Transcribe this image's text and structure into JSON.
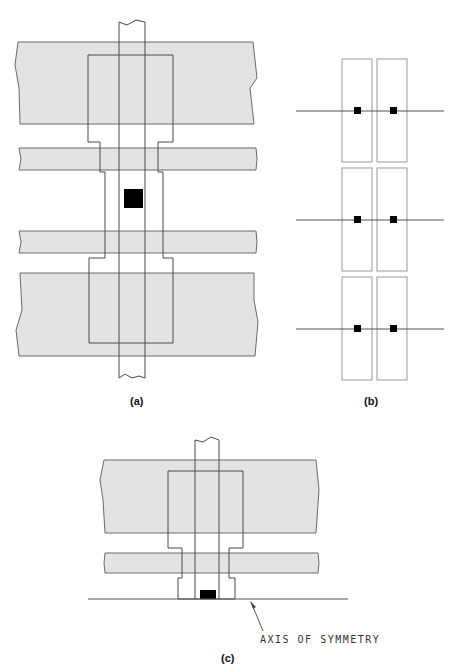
{
  "figure": {
    "panels": [
      {
        "id": "a",
        "caption": "(a)",
        "description": "MOS layout: two wide diffusion bands and two thin poly bands crossed by a vertical metal strip with a central contact"
      },
      {
        "id": "b",
        "caption": "(b)",
        "description": "Three rows of paired rectangles each with two contacts on a horizontal line"
      },
      {
        "id": "c",
        "caption": "(c)",
        "description": "Half layout mirrored about the axis of symmetry"
      }
    ],
    "annotations": {
      "axis_label": "AXIS OF SYMMETRY"
    },
    "colors": {
      "band_fill": "#e3e3e3",
      "outline": "#4a4a4a",
      "contact": "#000000"
    }
  }
}
